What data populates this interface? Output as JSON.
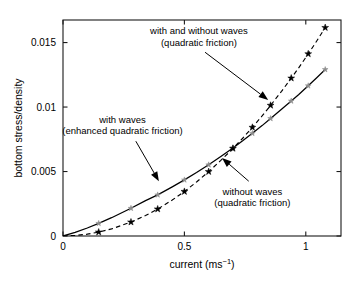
{
  "figure": {
    "background": "#ffffff",
    "frame_color": "#1a1a1a",
    "curve_solid_color": "#000000",
    "curve_dashed_color": "#000000",
    "marker_black_color": "#000000",
    "marker_gray_color": "#8c8c8c"
  },
  "chart_data": {
    "type": "line",
    "title": "",
    "xlabel": "current (ms−1)",
    "ylabel": "bottom stress/density",
    "xlim": [
      0,
      1.145
    ],
    "ylim": [
      0,
      0.01675
    ],
    "xticks": [
      0,
      0.5,
      1
    ],
    "xticklabels": [
      "0",
      "0.5",
      "1"
    ],
    "yticks": [
      0,
      0.005,
      0.01,
      0.015
    ],
    "yticklabels": [
      "0",
      "0.005",
      "0.01",
      "0.015"
    ],
    "grid": false,
    "legend": "none (inline annotations with arrows)",
    "series": [
      {
        "name": "with waves (enhanced quadratic friction)",
        "style": "solid",
        "marker": "star-gray",
        "x": [
          0.0,
          0.05,
          0.1,
          0.147,
          0.2,
          0.28,
          0.34,
          0.39,
          0.45,
          0.5,
          0.55,
          0.6,
          0.65,
          0.7,
          0.74,
          0.78,
          0.82,
          0.855,
          0.9,
          0.94,
          0.97,
          1.01,
          1.045,
          1.08
        ],
        "y": [
          0.0,
          0.00028,
          0.00062,
          0.00098,
          0.00142,
          0.00215,
          0.00274,
          0.00319,
          0.00381,
          0.00435,
          0.00492,
          0.00552,
          0.00616,
          0.00683,
          0.00738,
          0.00796,
          0.00856,
          0.00911,
          0.00983,
          0.01047,
          0.01096,
          0.01165,
          0.01227,
          0.01291
        ],
        "marker_x": [
          0.147,
          0.28,
          0.39,
          0.5,
          0.6,
          0.7,
          0.78,
          0.855,
          0.94,
          1.01,
          1.08
        ],
        "marker_y": [
          0.00098,
          0.00215,
          0.00319,
          0.00435,
          0.00552,
          0.00683,
          0.00796,
          0.00911,
          0.01047,
          0.01165,
          0.01291
        ]
      },
      {
        "name": "without waves (quadratic friction)",
        "style": "dashed",
        "marker": "star-black",
        "x": [
          0.0,
          0.05,
          0.1,
          0.147,
          0.2,
          0.28,
          0.34,
          0.39,
          0.45,
          0.5,
          0.55,
          0.6,
          0.65,
          0.7,
          0.74,
          0.78,
          0.82,
          0.855,
          0.9,
          0.94,
          0.97,
          1.01,
          1.045,
          1.08
        ],
        "y": [
          0.0,
          4e-05,
          0.00014,
          0.0003,
          0.00055,
          0.00108,
          0.00159,
          0.00209,
          0.00279,
          0.00345,
          0.00419,
          0.00499,
          0.00586,
          0.00679,
          0.00758,
          0.00842,
          0.00931,
          0.01013,
          0.01122,
          0.01224,
          0.01302,
          0.01412,
          0.01512,
          0.01616
        ],
        "marker_x": [
          0.147,
          0.28,
          0.39,
          0.5,
          0.6,
          0.7,
          0.78,
          0.855,
          0.94,
          1.01,
          1.08
        ],
        "marker_y": [
          0.0003,
          0.00108,
          0.00209,
          0.00345,
          0.00499,
          0.00679,
          0.00842,
          0.01013,
          0.01224,
          0.01412,
          0.01616
        ]
      }
    ],
    "annotations": [
      {
        "id": "anno-top",
        "lines": [
          "with and without waves",
          "(quadratic friction)"
        ],
        "text_x": 0.56,
        "text_y": 0.01565,
        "arrow_from": [
          0.585,
          0.01425
        ],
        "arrow_to": [
          0.845,
          0.01055
        ]
      },
      {
        "id": "anno-left",
        "lines": [
          "with waves",
          "(enhanced quadratic friction)"
        ],
        "text_x": 0.245,
        "text_y": 0.00877,
        "arrow_from": [
          0.3,
          0.00735
        ],
        "arrow_to": [
          0.395,
          0.00425
        ]
      },
      {
        "id": "anno-right",
        "lines": [
          "without waves",
          "(quadratic friction)"
        ],
        "text_x": 0.78,
        "text_y": 0.00318,
        "arrow_from": [
          0.765,
          0.00425
        ],
        "arrow_to": [
          0.655,
          0.00605
        ]
      }
    ]
  }
}
